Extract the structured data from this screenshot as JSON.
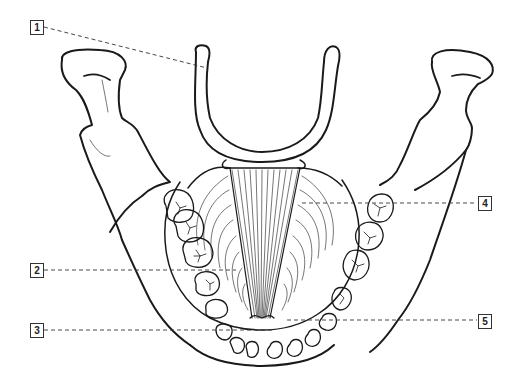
{
  "diagram": {
    "line_color": "#1a1a1a",
    "leader_color": "#333333",
    "labels": [
      {
        "id": "1",
        "text": "1",
        "x": 30,
        "y": 20,
        "target": [
          207,
          68
        ]
      },
      {
        "id": "2",
        "text": "2",
        "x": 30,
        "y": 263,
        "target": [
          236,
          270
        ]
      },
      {
        "id": "3",
        "text": "3",
        "x": 30,
        "y": 323,
        "target": [
          272,
          330
        ]
      },
      {
        "id": "4",
        "text": "4",
        "x": 478,
        "y": 196,
        "target": [
          302,
          203
        ]
      },
      {
        "id": "5",
        "text": "5",
        "x": 478,
        "y": 314,
        "target": [
          287,
          320
        ]
      }
    ]
  }
}
